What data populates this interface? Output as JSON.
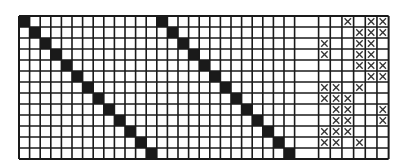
{
  "diagram": {
    "type": "grid-pattern",
    "rows": 13,
    "colors": {
      "background": "#ffffff",
      "line": "#1a1a1a",
      "filled": "#1a1a1a",
      "mark": "#333333"
    },
    "left_section": {
      "columns": 26,
      "cell_width": 10.6,
      "description": "two diagonal bands of filled squares",
      "diagonals": [
        {
          "start_row": 0,
          "start_col": 0,
          "length": 13
        },
        {
          "start_row": 0,
          "start_col": 13,
          "length": 13
        }
      ]
    },
    "spacer_column": {
      "width": 24
    },
    "right_section": {
      "columns": 6,
      "cell_width": 11.67,
      "description": "cells marked with an X",
      "marks": [
        {
          "row": 0,
          "cols": [
            2,
            4,
            5
          ]
        },
        {
          "row": 1,
          "cols": [
            3,
            4,
            5
          ]
        },
        {
          "row": 2,
          "cols": [
            0,
            3,
            4
          ]
        },
        {
          "row": 3,
          "cols": [
            0,
            3,
            4
          ]
        },
        {
          "row": 4,
          "cols": [
            3,
            4,
            5
          ]
        },
        {
          "row": 5,
          "cols": [
            4,
            5
          ]
        },
        {
          "row": 6,
          "cols": [
            0,
            1,
            3
          ]
        },
        {
          "row": 7,
          "cols": [
            0,
            1,
            2
          ]
        },
        {
          "row": 8,
          "cols": [
            1,
            2,
            5
          ]
        },
        {
          "row": 9,
          "cols": [
            1,
            2,
            5
          ]
        },
        {
          "row": 10,
          "cols": [
            0,
            1,
            2
          ]
        },
        {
          "row": 11,
          "cols": [
            0,
            1,
            3
          ]
        },
        {
          "row": 12,
          "cols": []
        }
      ]
    },
    "row_height": 11
  }
}
